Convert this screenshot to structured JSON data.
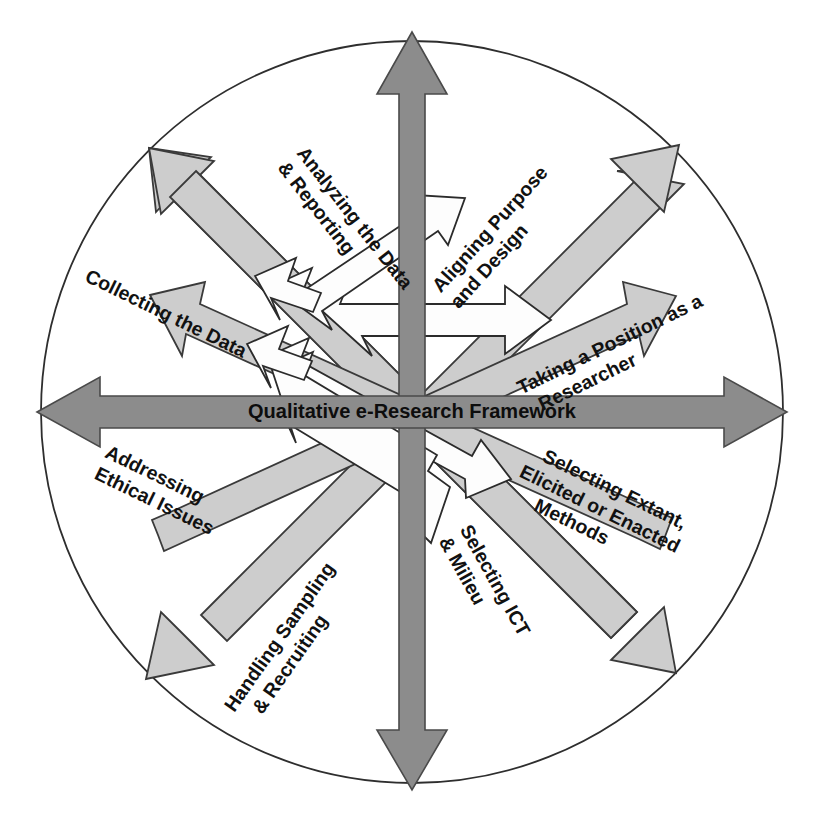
{
  "figure": {
    "title": "Qualitative e-Research Framework",
    "shape": "circle-with-eight-radiating-double-arrows",
    "colors": {
      "background": "#ffffff",
      "axis_arrow_fill": "#8c8c8c",
      "axis_arrow_stroke": "#4a4a4a",
      "diagonal_arrow_fill": "#cdcdcd",
      "diagonal_arrow_stroke": "#3a3a3a",
      "inner_arrow_fill": "#fdfdfd",
      "inner_arrow_stroke": "#2b2b2b",
      "circle_stroke": "#2e2e2e",
      "text": "#111111"
    },
    "circle": {
      "center_x": 412,
      "center_y": 412,
      "radius": 371
    }
  },
  "center": {
    "label": "Qualitative e-Research Framework"
  },
  "spokes": [
    {
      "id": "aligning-purpose-and-design",
      "label_lines": [
        "Aligning Purpose",
        "and Design"
      ],
      "direction_deg": 45,
      "compass": "north-east",
      "arrow_kind": "diagonal-double-arrow"
    },
    {
      "id": "taking-a-position-as-a-researcher",
      "label_lines": [
        "Taking a Position as a",
        "Researcher"
      ],
      "direction_deg": 22,
      "compass": "east-north-east",
      "arrow_kind": "diagonal-double-arrow"
    },
    {
      "id": "selecting-extant-elicited-or-enacted-methods",
      "label_lines": [
        "Selecting Extant,",
        "Elicited or Enacted",
        "Methods"
      ],
      "direction_deg": -22,
      "compass": "east-south-east",
      "arrow_kind": "diagonal-double-arrow"
    },
    {
      "id": "selecting-ict-and-milieu",
      "label_lines": [
        "Selecting ICT",
        "& Milieu"
      ],
      "direction_deg": -45,
      "compass": "south-east",
      "arrow_kind": "diagonal-double-arrow"
    },
    {
      "id": "handling-sampling-and-recruiting",
      "label_lines": [
        "Handling Sampling",
        "& Recruiting"
      ],
      "direction_deg": -135,
      "compass": "south-west",
      "arrow_kind": "diagonal-double-arrow"
    },
    {
      "id": "addressing-ethical-issues",
      "label_lines": [
        "Addressing",
        "Ethical Issues"
      ],
      "direction_deg": 202,
      "compass": "west-south-west",
      "arrow_kind": "diagonal-double-arrow"
    },
    {
      "id": "collecting-the-data",
      "label_lines": [
        "Collecting the Data"
      ],
      "direction_deg": 158,
      "compass": "west-north-west",
      "arrow_kind": "diagonal-double-arrow"
    },
    {
      "id": "analyzing-the-data-and-reporting",
      "label_lines": [
        "Analyzing the Data",
        "& Reporting"
      ],
      "direction_deg": 135,
      "compass": "north-west",
      "arrow_kind": "diagonal-double-arrow"
    }
  ],
  "axes": [
    {
      "id": "vertical-axis",
      "orientation": "vertical",
      "style": "dark-gray-double-arrow"
    },
    {
      "id": "horizontal-axis",
      "orientation": "horizontal",
      "style": "dark-gray-double-arrow",
      "carries_label": "Qualitative e-Research Framework"
    }
  ]
}
